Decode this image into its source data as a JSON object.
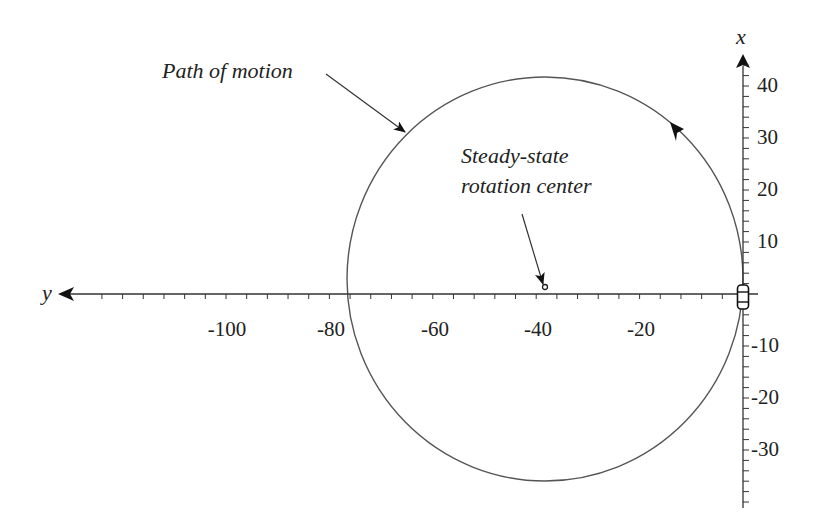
{
  "chart_data": {
    "type": "diagram",
    "title": "",
    "axes": {
      "horizontal": {
        "label": "y",
        "direction": "positive to the left (arrow points left)",
        "ticks": [
          -100,
          -80,
          -60,
          -40,
          -20
        ],
        "minor_tick_step": 4,
        "range": [
          -125,
          3
        ]
      },
      "vertical": {
        "label": "x",
        "direction": "up",
        "ticks": [
          40,
          30,
          20,
          10,
          -10,
          -20,
          -30
        ],
        "minor_tick_step": 2,
        "range": [
          -41,
          45
        ]
      }
    },
    "circle": {
      "center": [
        -38,
        -3
      ],
      "radius": 38.5,
      "direction": "counter-clockwise (arrow on upper-right arc points up-left)"
    },
    "rotation_center_point": {
      "y": -38,
      "x": 1
    },
    "vehicle_position": {
      "y": 0,
      "x": 0
    },
    "annotations": [
      {
        "text": "Path of motion",
        "points_to": "circle upper-left arc"
      },
      {
        "text": "Steady-state rotation center",
        "points_to": "center dot near (-38, 1)"
      }
    ],
    "grid": false
  },
  "labels": {
    "x_axis": "x",
    "y_axis": "y",
    "path_annotation": "Path of motion",
    "center_annotation_line1": "Steady-state",
    "center_annotation_line2": "rotation center"
  },
  "tick_labels": {
    "horizontal": [
      "-100",
      "-80",
      "-60",
      "-40",
      "-20"
    ],
    "vertical_pos": [
      "40",
      "30",
      "20",
      "10"
    ],
    "vertical_neg": [
      "-10",
      "-20",
      "-30"
    ]
  },
  "colors": {
    "ink": "#222222",
    "curve": "#555555"
  }
}
